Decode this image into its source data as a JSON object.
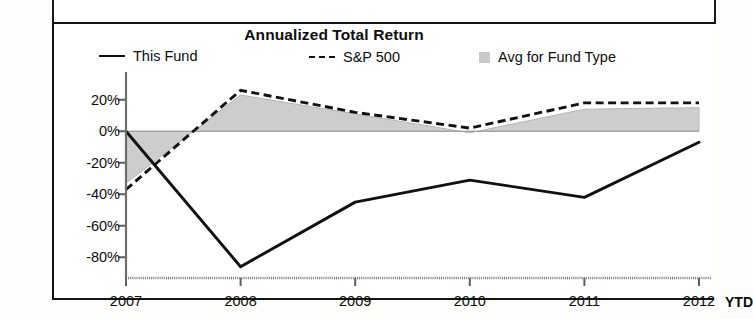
{
  "panel": {
    "title": "Annualized Total Return"
  },
  "legend": {
    "items": [
      {
        "label": "This Fund",
        "marker": "solid-line-swatch"
      },
      {
        "label": "S&P 500",
        "marker": "dashed-line-swatch"
      },
      {
        "label": "Avg for Fund Type",
        "marker": "gray-box-swatch"
      }
    ]
  },
  "axis": {
    "x_suffix_label": "YTD",
    "y_ticks": [
      "20%",
      "0%",
      "-20%",
      "-40%",
      "-60%",
      "-80%"
    ],
    "x_ticks": [
      "2007",
      "2008",
      "2009",
      "2010",
      "2011",
      "2012"
    ]
  },
  "colors": {
    "this_fund": "#111111",
    "sp500": "#111111",
    "avg_fund_type": "#c9c9c9",
    "frame": "#141414",
    "background": "#ffffff"
  },
  "chart_data": {
    "type": "line",
    "title": "Annualized Total Return",
    "xlabel": "",
    "ylabel": "",
    "categories": [
      "2007",
      "2008",
      "2009",
      "2010",
      "2011",
      "2012"
    ],
    "x_note": "2012 column is year-to-date (YTD)",
    "ylim": [
      -90,
      30
    ],
    "ytick_values": [
      20,
      0,
      -20,
      -40,
      -60,
      -80
    ],
    "grid": false,
    "legend_position": "top",
    "series": [
      {
        "name": "This Fund",
        "style": "solid",
        "values": [
          0,
          -86,
          -45,
          -31,
          -42,
          -7
        ]
      },
      {
        "name": "S&P 500",
        "style": "dashed",
        "values": [
          -37,
          26,
          12,
          2,
          18,
          18
        ]
      },
      {
        "name": "Avg for Fund Type",
        "style": "filled-area",
        "values": [
          -33,
          23,
          11,
          -1,
          14,
          15
        ]
      }
    ]
  }
}
